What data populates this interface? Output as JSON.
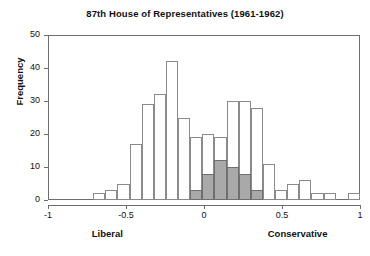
{
  "chart_data": {
    "type": "bar",
    "title": "87th House of Representatives (1961-1962)",
    "xlabel": "",
    "ylabel": "Frequency",
    "xlim": [
      -1,
      1
    ],
    "ylim": [
      0,
      50
    ],
    "grid": false,
    "legend": "none",
    "bin_width": 0.1,
    "xticks": [
      -1,
      -0.5,
      0,
      0.5,
      1
    ],
    "xtick_labels": [
      "-1",
      "-0.5",
      "0",
      "0.5",
      "1"
    ],
    "yticks": [
      0,
      10,
      20,
      30,
      40,
      50
    ],
    "ytick_labels": [
      "0",
      "10",
      "20",
      "30",
      "40",
      "50"
    ],
    "pole_labels": {
      "left": "Liberal",
      "right": "Conservative"
    },
    "series": [
      {
        "name": "All members",
        "style": "outline",
        "color": "#ffffff",
        "edge_color": "#8a8a8a",
        "bins": [
          -0.7,
          -0.6,
          -0.5,
          -0.4,
          -0.3,
          -0.2,
          -0.1,
          0.0,
          0.1,
          0.2,
          0.3,
          0.4,
          0.5,
          0.6,
          0.7,
          0.8,
          0.9
        ],
        "values": [
          2,
          3,
          5,
          17,
          29,
          32,
          42,
          25,
          19,
          20,
          19,
          30,
          30,
          28,
          11,
          3,
          5,
          6,
          2,
          2,
          0,
          2
        ]
      },
      {
        "name": "Shaded subgroup",
        "style": "filled",
        "color": "#a9a9a9",
        "edge_color": "#6f6f6f",
        "values": [
          0,
          0,
          0,
          0,
          0,
          0,
          0,
          0,
          0,
          3,
          8,
          12,
          10,
          8,
          3,
          0,
          0,
          0,
          0,
          0,
          0,
          0
        ]
      }
    ],
    "bars": [
      {
        "x0": -0.71,
        "x1": -0.61,
        "total": 2,
        "shaded": 0
      },
      {
        "x0": -0.61,
        "x1": -0.51,
        "total": 3,
        "shaded": 0
      },
      {
        "x0": -0.51,
        "x1": -0.41,
        "total": 5,
        "shaded": 0
      },
      {
        "x0": -0.41,
        "x1": -0.31,
        "total": 17,
        "shaded": 0
      },
      {
        "x0": -0.31,
        "x1": -0.21,
        "total": 29,
        "shaded": 0
      },
      {
        "x0": -0.21,
        "x1": -0.11,
        "total": 32,
        "shaded": 0
      },
      {
        "x0": -0.11,
        "x1": -0.01,
        "total": 42,
        "shaded": 0
      },
      {
        "x0": -0.01,
        "x1": 0.09,
        "total": 25,
        "shaded": 0
      },
      {
        "x0": 0.09,
        "x1": 0.19,
        "total": 19,
        "shaded": 3
      },
      {
        "x0": 0.19,
        "x1": 0.29,
        "total": 20,
        "shaded": 8
      },
      {
        "x0": 0.29,
        "x1": 0.39,
        "total": 19,
        "shaded": 12
      },
      {
        "x0": 0.39,
        "x1": 0.49,
        "total": 30,
        "shaded": 10
      },
      {
        "x0": 0.49,
        "x1": 0.59,
        "total": 30,
        "shaded": 8
      },
      {
        "x0": 0.59,
        "x1": 0.69,
        "total": 28,
        "shaded": 3
      },
      {
        "x0": 0.69,
        "x1": 0.79,
        "total": 11,
        "shaded": 0
      },
      {
        "x0": 0.79,
        "x1": 0.89,
        "total": 3,
        "shaded": 0
      },
      {
        "x0": 0.89,
        "x1": 0.99,
        "total": 5,
        "shaded": 0
      },
      {
        "x0": 0.99,
        "x1": 1.09,
        "total": 6,
        "shaded": 0
      },
      {
        "x0": 1.09,
        "x1": 1.19,
        "total": 2,
        "shaded": 0
      },
      {
        "x0": 1.19,
        "x1": 1.29,
        "total": 2,
        "shaded": 0
      },
      {
        "x0": 1.39,
        "x1": 1.49,
        "total": 2,
        "shaded": 0
      }
    ]
  }
}
